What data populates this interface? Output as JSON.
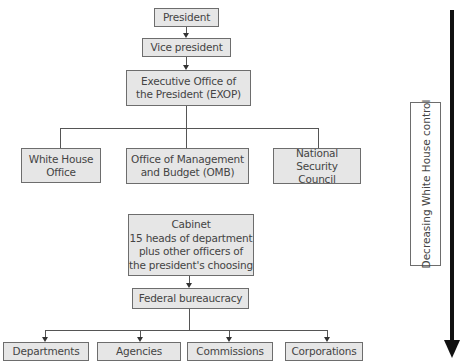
{
  "diagram": {
    "nodes": {
      "president": "President",
      "vice_president": "Vice president",
      "exop": [
        "Executive Office of",
        "the President (EXOP)"
      ],
      "white_house_office": [
        "White House",
        "Office"
      ],
      "omb": [
        "Office of Management",
        "and Budget (OMB)"
      ],
      "nsc": [
        "National Security",
        "Council"
      ],
      "cabinet": [
        "Cabinet",
        "15 heads of department",
        "plus other officers of",
        "the president's choosing"
      ],
      "federal_bureaucracy": "Federal bureaucracy",
      "departments": "Departments",
      "agencies": "Agencies",
      "commissions": "Commissions",
      "corporations": "Corporations"
    },
    "side_label": "Decreasing White House control",
    "colors": {
      "box_fill": "#e6e6e6",
      "box_border": "#6d6d6d",
      "arrow": "#111111"
    }
  }
}
